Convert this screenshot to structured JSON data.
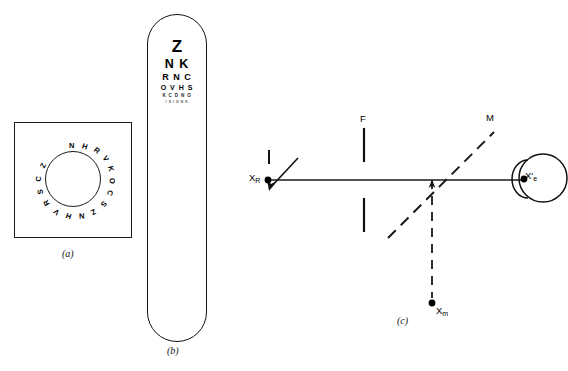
{
  "figure": {
    "background_color": "#ffffff",
    "ink_color": "#000000"
  },
  "captions": {
    "a": "(a)",
    "b": "(b)",
    "c": "(c)"
  },
  "panel_a": {
    "name": "circular letter chart card",
    "shape": "square card with circular ring of letters",
    "ring_letters": [
      "N",
      "H",
      "R",
      "V",
      "K",
      "O",
      "C",
      "S",
      "Z",
      "N",
      "H",
      "V",
      "R",
      "S",
      "C",
      "Z"
    ],
    "ring_letter_count": 16,
    "border_color": "#1a1a1a"
  },
  "panel_b": {
    "name": "handheld acuity chart paddle",
    "shape": "rounded rectangle paddle",
    "rows": [
      {
        "text": "Z",
        "size": "largest"
      },
      {
        "text": "N K",
        "size": "large"
      },
      {
        "text": "R N C",
        "size": "medium"
      },
      {
        "text": "O V H S",
        "size": "small"
      },
      {
        "text": "K C D N O",
        "size": "smaller"
      },
      {
        "text": "I S I D N K",
        "size": "smallest"
      }
    ],
    "border_color": "#111111"
  },
  "panel_c": {
    "name": "optical ray diagram",
    "labels": {
      "focal_plane": "F",
      "mirror": "M",
      "retinal_point": "X",
      "retinal_point_sub": "R",
      "mirror_image_point": "X",
      "mirror_image_sub": "m",
      "eye_point": "X'",
      "eye_point_sub": "e"
    },
    "elements": {
      "axis": "horizontal optical axis line",
      "mirror_line": "dashed diagonal line M",
      "drop_line": "vertical dashed line to X sub m",
      "aperture": "two vertical bars labelled F",
      "eye": "circle with cornea arc on left",
      "arrow": "short arrow at X sub R"
    },
    "line_color": "#000000",
    "dash_color": "#1a1a1a"
  }
}
